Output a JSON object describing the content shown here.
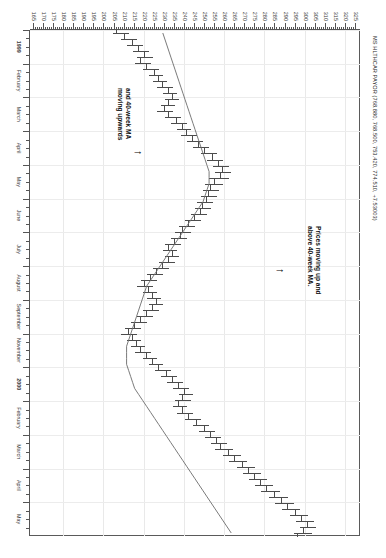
{
  "chart_data": {
    "type": "bar",
    "chart_style": "ohlc-bar-with-moving-average",
    "title": "MS HLTHCAR PAYOR (768.880, 768.500, 753.420, 774.510, +7.53003)",
    "xlabel": "",
    "ylabel": "",
    "orientation": "rotated-90-clockwise",
    "grid": true,
    "legend_position": "none",
    "ylim": [
      163,
      327
    ],
    "ytick_labels": [
      "325",
      "320",
      "315",
      "310",
      "305",
      "300",
      "295",
      "290",
      "285",
      "280",
      "275",
      "270",
      "265",
      "260",
      "255",
      "250",
      "245",
      "240",
      "235",
      "230",
      "225",
      "220",
      "215",
      "210",
      "205",
      "200",
      "195",
      "190",
      "185",
      "180",
      "175",
      "170",
      "165"
    ],
    "ytick_values": [
      325,
      320,
      315,
      310,
      305,
      300,
      295,
      290,
      285,
      280,
      275,
      270,
      265,
      260,
      255,
      250,
      245,
      240,
      235,
      230,
      225,
      220,
      215,
      210,
      205,
      200,
      195,
      190,
      185,
      180,
      175,
      170,
      165
    ],
    "xtick_labels": [
      "1999",
      "February",
      "March",
      "April",
      "May",
      "June",
      "July",
      "August",
      "September",
      "November",
      "2000",
      "February",
      "March",
      "April",
      "May"
    ],
    "annotations": [
      {
        "id": "annot-1",
        "text": "Prices moving up and\nabove 40-week MA.",
        "arrow": "up"
      },
      {
        "id": "annot-2",
        "text": "and 40-week MA\nmoving upwards",
        "arrow": "up"
      }
    ],
    "series": [
      {
        "name": "Weekly price bars (OHLC)",
        "type": "ohlc",
        "color": "#4c4c4c",
        "bars": [
          {
            "o": 206,
            "h": 212,
            "l": 204,
            "c": 210
          },
          {
            "o": 210,
            "h": 216,
            "l": 208,
            "c": 214
          },
          {
            "o": 214,
            "h": 219,
            "l": 211,
            "c": 217
          },
          {
            "o": 217,
            "h": 222,
            "l": 214,
            "c": 220
          },
          {
            "o": 220,
            "h": 224,
            "l": 216,
            "c": 218
          },
          {
            "o": 218,
            "h": 223,
            "l": 215,
            "c": 221
          },
          {
            "o": 221,
            "h": 227,
            "l": 219,
            "c": 225
          },
          {
            "o": 225,
            "h": 229,
            "l": 222,
            "c": 227
          },
          {
            "o": 227,
            "h": 231,
            "l": 224,
            "c": 229
          },
          {
            "o": 229,
            "h": 234,
            "l": 226,
            "c": 232
          },
          {
            "o": 232,
            "h": 236,
            "l": 229,
            "c": 234
          },
          {
            "o": 234,
            "h": 237,
            "l": 230,
            "c": 232
          },
          {
            "o": 232,
            "h": 235,
            "l": 228,
            "c": 230
          },
          {
            "o": 230,
            "h": 234,
            "l": 226,
            "c": 232
          },
          {
            "o": 232,
            "h": 238,
            "l": 230,
            "c": 236
          },
          {
            "o": 236,
            "h": 241,
            "l": 233,
            "c": 239
          },
          {
            "o": 239,
            "h": 243,
            "l": 236,
            "c": 241
          },
          {
            "o": 241,
            "h": 246,
            "l": 238,
            "c": 244
          },
          {
            "o": 244,
            "h": 249,
            "l": 241,
            "c": 247
          },
          {
            "o": 247,
            "h": 252,
            "l": 244,
            "c": 250
          },
          {
            "o": 250,
            "h": 256,
            "l": 248,
            "c": 254
          },
          {
            "o": 254,
            "h": 259,
            "l": 251,
            "c": 257
          },
          {
            "o": 257,
            "h": 262,
            "l": 254,
            "c": 259
          },
          {
            "o": 259,
            "h": 263,
            "l": 255,
            "c": 258
          },
          {
            "o": 258,
            "h": 262,
            "l": 252,
            "c": 255
          },
          {
            "o": 255,
            "h": 259,
            "l": 250,
            "c": 253
          },
          {
            "o": 253,
            "h": 257,
            "l": 249,
            "c": 252
          },
          {
            "o": 252,
            "h": 256,
            "l": 248,
            "c": 251
          },
          {
            "o": 251,
            "h": 254,
            "l": 246,
            "c": 249
          },
          {
            "o": 249,
            "h": 253,
            "l": 245,
            "c": 248
          },
          {
            "o": 248,
            "h": 251,
            "l": 243,
            "c": 245
          },
          {
            "o": 245,
            "h": 248,
            "l": 240,
            "c": 242
          },
          {
            "o": 242,
            "h": 245,
            "l": 237,
            "c": 239
          },
          {
            "o": 239,
            "h": 243,
            "l": 235,
            "c": 238
          },
          {
            "o": 238,
            "h": 241,
            "l": 233,
            "c": 235
          },
          {
            "o": 235,
            "h": 238,
            "l": 230,
            "c": 232
          },
          {
            "o": 232,
            "h": 236,
            "l": 229,
            "c": 234
          },
          {
            "o": 234,
            "h": 237,
            "l": 230,
            "c": 232
          },
          {
            "o": 232,
            "h": 235,
            "l": 227,
            "c": 229
          },
          {
            "o": 229,
            "h": 232,
            "l": 224,
            "c": 226
          },
          {
            "o": 226,
            "h": 229,
            "l": 221,
            "c": 223
          },
          {
            "o": 223,
            "h": 226,
            "l": 218,
            "c": 220
          },
          {
            "o": 220,
            "h": 224,
            "l": 216,
            "c": 222
          },
          {
            "o": 222,
            "h": 226,
            "l": 219,
            "c": 224
          },
          {
            "o": 224,
            "h": 228,
            "l": 221,
            "c": 226
          },
          {
            "o": 226,
            "h": 229,
            "l": 222,
            "c": 224
          },
          {
            "o": 224,
            "h": 227,
            "l": 219,
            "c": 221
          },
          {
            "o": 221,
            "h": 224,
            "l": 216,
            "c": 218
          },
          {
            "o": 218,
            "h": 221,
            "l": 213,
            "c": 215
          },
          {
            "o": 215,
            "h": 218,
            "l": 210,
            "c": 212
          },
          {
            "o": 212,
            "h": 216,
            "l": 208,
            "c": 214
          },
          {
            "o": 214,
            "h": 218,
            "l": 211,
            "c": 216
          },
          {
            "o": 216,
            "h": 220,
            "l": 213,
            "c": 218
          },
          {
            "o": 218,
            "h": 223,
            "l": 215,
            "c": 221
          },
          {
            "o": 221,
            "h": 226,
            "l": 219,
            "c": 224
          },
          {
            "o": 224,
            "h": 229,
            "l": 222,
            "c": 227
          },
          {
            "o": 227,
            "h": 233,
            "l": 225,
            "c": 231
          },
          {
            "o": 231,
            "h": 236,
            "l": 228,
            "c": 234
          },
          {
            "o": 234,
            "h": 239,
            "l": 231,
            "c": 237
          },
          {
            "o": 237,
            "h": 242,
            "l": 234,
            "c": 240
          },
          {
            "o": 240,
            "h": 244,
            "l": 237,
            "c": 239
          },
          {
            "o": 239,
            "h": 243,
            "l": 235,
            "c": 237
          },
          {
            "o": 237,
            "h": 241,
            "l": 234,
            "c": 239
          },
          {
            "o": 239,
            "h": 244,
            "l": 236,
            "c": 242
          },
          {
            "o": 242,
            "h": 248,
            "l": 240,
            "c": 246
          },
          {
            "o": 246,
            "h": 252,
            "l": 244,
            "c": 250
          },
          {
            "o": 250,
            "h": 255,
            "l": 247,
            "c": 253
          },
          {
            "o": 253,
            "h": 258,
            "l": 250,
            "c": 256
          },
          {
            "o": 256,
            "h": 261,
            "l": 253,
            "c": 258
          },
          {
            "o": 258,
            "h": 264,
            "l": 255,
            "c": 262
          },
          {
            "o": 262,
            "h": 268,
            "l": 259,
            "c": 265
          },
          {
            "o": 265,
            "h": 271,
            "l": 262,
            "c": 269
          },
          {
            "o": 269,
            "h": 275,
            "l": 266,
            "c": 272
          },
          {
            "o": 272,
            "h": 278,
            "l": 269,
            "c": 275
          },
          {
            "o": 275,
            "h": 281,
            "l": 272,
            "c": 278
          },
          {
            "o": 278,
            "h": 284,
            "l": 275,
            "c": 281
          },
          {
            "o": 281,
            "h": 287,
            "l": 278,
            "c": 285
          },
          {
            "o": 285,
            "h": 291,
            "l": 282,
            "c": 288
          },
          {
            "o": 288,
            "h": 294,
            "l": 285,
            "c": 291
          },
          {
            "o": 291,
            "h": 297,
            "l": 288,
            "c": 295
          },
          {
            "o": 295,
            "h": 301,
            "l": 292,
            "c": 298
          },
          {
            "o": 298,
            "h": 304,
            "l": 295,
            "c": 301
          },
          {
            "o": 301,
            "h": 305,
            "l": 297,
            "c": 299
          },
          {
            "o": 299,
            "h": 303,
            "l": 294,
            "c": 296
          }
        ]
      },
      {
        "name": "40-week moving average",
        "type": "line",
        "color": "#6b6b6b",
        "values": [
          229,
          230,
          231,
          232,
          233,
          234,
          235,
          236,
          237,
          238,
          239,
          240,
          241,
          242,
          243,
          244,
          245,
          246,
          247,
          248,
          249,
          250,
          251,
          252,
          252,
          252,
          251,
          250,
          249,
          247,
          245,
          243,
          241,
          239,
          237,
          235,
          233,
          231,
          229,
          227,
          225,
          223,
          221,
          220,
          219,
          218,
          217,
          216,
          215,
          214,
          213,
          212,
          211,
          211,
          211,
          211,
          212,
          213,
          214,
          215,
          217,
          219,
          221,
          223,
          225,
          227,
          229,
          231,
          233,
          235,
          237,
          239,
          241,
          243,
          245,
          247,
          249,
          251,
          253,
          255,
          257,
          259,
          261,
          263
        ]
      }
    ]
  }
}
